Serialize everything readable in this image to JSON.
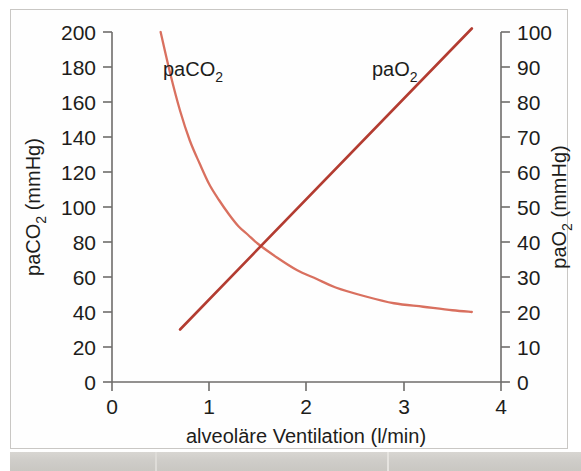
{
  "figure": {
    "name": "alveolar-ventilation-blood-gas-chart",
    "background_color": "#ffffff",
    "frame_color": "#c9c7c4"
  },
  "chart_data": {
    "type": "line",
    "title": "",
    "subtitle": "",
    "xlabel": "alveoläre Ventilation (l/min)",
    "ylabel": "paCO2 (mmHg)",
    "ylabel_right": "paO2 (mmHg)",
    "xlim": [
      0,
      4
    ],
    "ylim": [
      0,
      200
    ],
    "ylim_right": [
      0,
      100
    ],
    "grid": false,
    "legend": "inline-labels",
    "x_ticks": [
      0,
      1,
      2,
      3,
      4
    ],
    "x_tick_labels": [
      "0",
      "1",
      "2",
      "3",
      "4"
    ],
    "y_ticks_left": [
      0,
      20,
      40,
      60,
      80,
      100,
      120,
      140,
      160,
      180,
      200
    ],
    "y_tick_labels_left": [
      "0",
      "20",
      "40",
      "60",
      "80",
      "100",
      "120",
      "140",
      "160",
      "180",
      "200"
    ],
    "y_ticks_right": [
      0,
      10,
      20,
      30,
      40,
      50,
      60,
      70,
      80,
      90,
      100
    ],
    "y_tick_labels_right": [
      "0",
      "10",
      "20",
      "30",
      "40",
      "50",
      "60",
      "70",
      "80",
      "90",
      "100"
    ],
    "series": [
      {
        "name": "paCO2",
        "label": "paCO₂",
        "axis": "left",
        "color": "#d9705f",
        "shape": "hyperbolic-decay",
        "x": [
          0.5,
          0.6,
          0.7,
          0.8,
          0.9,
          1.0,
          1.1,
          1.2,
          1.3,
          1.4,
          1.5,
          1.7,
          1.9,
          2.1,
          2.3,
          2.6,
          2.9,
          3.2,
          3.5,
          3.7
        ],
        "values": [
          200,
          176,
          155,
          138,
          125,
          113,
          104,
          96,
          89,
          84,
          79,
          71,
          64,
          59,
          54,
          49,
          45,
          43,
          41,
          40
        ]
      },
      {
        "name": "paO2",
        "label": "paO₂",
        "axis": "right",
        "color": "#b33c31",
        "shape": "linear",
        "x": [
          0.7,
          3.7
        ],
        "values": [
          15,
          101
        ]
      }
    ],
    "annotations": [
      {
        "text": "paCO₂",
        "x": 1.0,
        "y_left": 180,
        "series": "paCO2"
      },
      {
        "text": "paO₂",
        "x": 2.9,
        "y_right": 88,
        "series": "paO2"
      }
    ],
    "intersection": {
      "x": 1.55,
      "paCO2": 76,
      "paO2": 36
    }
  },
  "axes": {
    "x_label": "alveoläre Ventilation (l/min)",
    "y_left_label_prefix": "paCO",
    "y_left_label_sub": "2",
    "y_left_label_suffix": " (mmHg)",
    "y_right_label_prefix": "paO",
    "y_right_label_sub": "2",
    "y_right_label_suffix": " (mmHg)"
  },
  "labels": {
    "paco2_prefix": "paCO",
    "paco2_sub": "2",
    "pao2_prefix": "paO",
    "pao2_sub": "2"
  }
}
